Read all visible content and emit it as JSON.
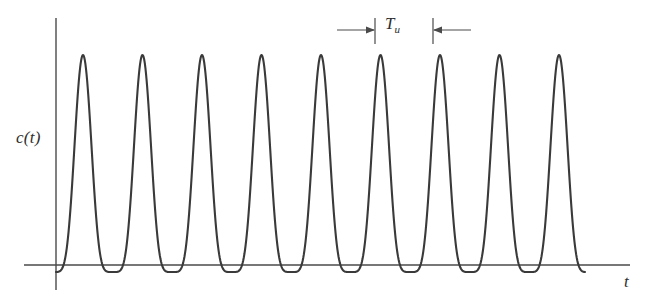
{
  "figure": {
    "background_color": "#ffffff",
    "stroke_color": "#3a3a3a",
    "axis_color": "#4a4a4a",
    "y_axis_label": "c(t)",
    "x_axis_label": "t",
    "period_label_base": "T",
    "period_label_subscript": "u"
  },
  "chart_data": {
    "type": "line",
    "title": "",
    "subtitle": "",
    "xlabel": "t",
    "ylabel": "c(t)",
    "grid": false,
    "legend": null,
    "annotations": [
      {
        "name": "period-marker",
        "label": "T_u",
        "description": "Double-headed span marker between two adjacent peaks indicating the useful symbol period",
        "x_start": 375,
        "x_end": 433,
        "y": 30
      }
    ],
    "axes": {
      "x_axis_pixel_y": 265,
      "x_axis_pixel_start": 24,
      "x_axis_pixel_end": 630,
      "y_axis_pixel_x": 56,
      "y_axis_pixel_top": 18,
      "y_axis_pixel_bottom": 290
    },
    "waveform": {
      "description": "Periodic raised-cosine-like pulse train with narrow sharp peaks and rounded troughs dipping slightly below the t-axis",
      "period_px": 59.5,
      "first_peak_x": 83,
      "num_full_peaks": 9,
      "peak_pixel_y": 55,
      "trough_pixel_y": 272,
      "baseline_pixel_y": 265,
      "curve_start_x": 56,
      "curve_end_x": 585,
      "exponent": 2.6,
      "peak_x_positions": [
        83,
        142.5,
        202,
        261.5,
        321,
        380.5,
        440,
        499.5,
        559
      ],
      "trough_x_positions": [
        113,
        172.5,
        232,
        291.5,
        351,
        410.5,
        470,
        529.5,
        589
      ],
      "xlim": [
        0,
        648
      ],
      "ylim": [
        272,
        55
      ]
    }
  }
}
